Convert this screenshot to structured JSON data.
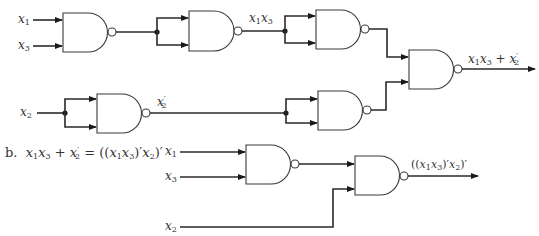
{
  "diagram": {
    "type": "logic-circuit",
    "gate_type": "NAND",
    "part_a": {
      "inputs": [
        "x1",
        "x3",
        "x2"
      ],
      "signals": {
        "product": "x1x3",
        "complement": "x'2",
        "output": "x1x3 + x'2"
      },
      "gates": [
        {
          "id": "g1",
          "inputs": [
            "x1",
            "x3"
          ],
          "output": "(x1x3)'"
        },
        {
          "id": "g2",
          "inputs": [
            "(x1x3)'",
            "(x1x3)'"
          ],
          "output": "x1x3"
        },
        {
          "id": "g3",
          "inputs": [
            "x1x3",
            "x1x3"
          ],
          "output": "(x1x3)'"
        },
        {
          "id": "g4",
          "inputs": [
            "x2",
            "x2"
          ],
          "output": "x'2"
        },
        {
          "id": "g5",
          "inputs": [
            "x'2",
            "x'2"
          ],
          "output": "x2"
        },
        {
          "id": "g6",
          "inputs": [
            "(x1x3)'",
            "x2"
          ],
          "output": "x1x3 + x'2"
        }
      ]
    },
    "part_b": {
      "caption_prefix": "b.",
      "equation": "x1x3 + x'2 = ((x1x3)'x2)'",
      "inputs": [
        "x1",
        "x3",
        "x2"
      ],
      "output": "((x1x3)'x2)'",
      "gates": [
        {
          "id": "gb1",
          "inputs": [
            "x1",
            "x3"
          ],
          "output": "(x1x3)'"
        },
        {
          "id": "gb2",
          "inputs": [
            "(x1x3)'",
            "x2"
          ],
          "output": "((x1x3)'x2)'"
        }
      ]
    }
  },
  "labels": {
    "a_x1": {
      "var": "x",
      "sub": "1"
    },
    "a_x3": {
      "var": "x",
      "sub": "3"
    },
    "a_x2": {
      "var": "x",
      "sub": "2"
    },
    "a_x1x3": {
      "v1": "x",
      "s1": "1",
      "v2": "x",
      "s2": "3"
    },
    "a_x2prime": {
      "var": "x",
      "sub": "2",
      "prime": "′"
    },
    "a_out": {
      "v1": "x",
      "s1": "1",
      "v2": "x",
      "s2": "3",
      "plus": "+",
      "v3": "x",
      "s3": "2",
      "prime": "′"
    },
    "b_caption": {
      "prefix": "b.",
      "v1": "x",
      "s1": "1",
      "v2": "x",
      "s2": "3",
      "plus": "+",
      "v3": "x",
      "s3": "2",
      "prime": "′",
      "eq": "=",
      "rhs_open": "((",
      "rhs_v1": "x",
      "rhs_s1": "1",
      "rhs_v2": "x",
      "rhs_s2": "3",
      "rhs_mid": ")′",
      "rhs_v3": "x",
      "rhs_s3": "2",
      "rhs_close": ")′"
    },
    "b_x1": {
      "var": "x",
      "sub": "1"
    },
    "b_x3": {
      "var": "x",
      "sub": "3"
    },
    "b_x2": {
      "var": "x",
      "sub": "2"
    },
    "b_out": {
      "open": "((",
      "v1": "x",
      "s1": "1",
      "v2": "x",
      "s2": "3",
      "mid": ")′",
      "v3": "x",
      "s3": "2",
      "close": ")′"
    }
  },
  "colors": {
    "line": "#2a2a2a",
    "text": "#333333",
    "background": "#ffffff"
  }
}
